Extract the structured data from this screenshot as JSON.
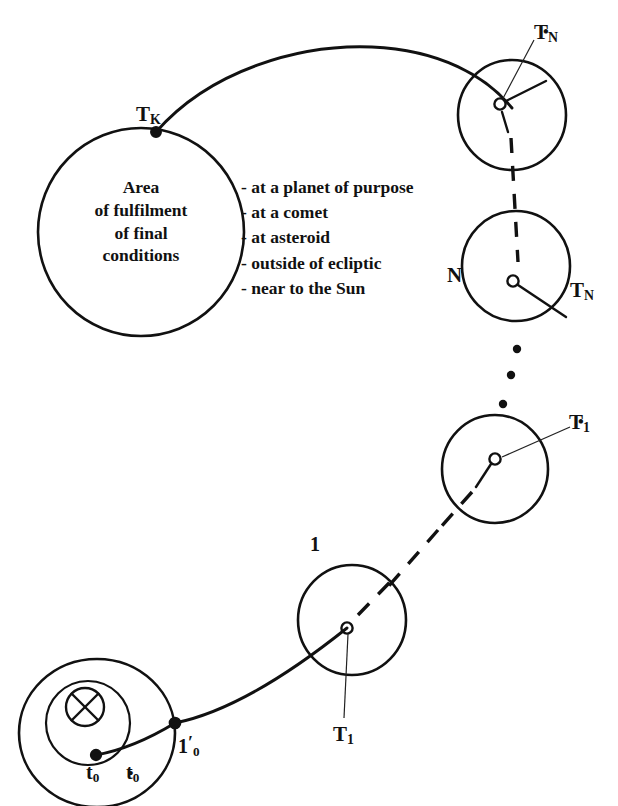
{
  "diagram": {
    "area_circle": {
      "name": "area-of-fulfilment",
      "lines": [
        "Area",
        "of fulfilment",
        "of final",
        "conditions"
      ]
    },
    "conditions_list": {
      "name": "final-conditions-list",
      "items": [
        "- at a planet of purpose",
        "- at a comet",
        "- at asteroid",
        "- outside of ecliptic",
        "- near to the Sun"
      ]
    },
    "labels": {
      "tk": {
        "base": "T",
        "sub": "K",
        "star": false
      },
      "tn_star": {
        "base": "T",
        "sub": "N",
        "star": true
      },
      "tn": {
        "base": "T",
        "sub": "N",
        "star": false
      },
      "n": {
        "base": "N",
        "sub": "",
        "star": false
      },
      "t1_star": {
        "base": "T",
        "sub": "1",
        "star": true
      },
      "t1": {
        "base": "T",
        "sub": "1",
        "star": false
      },
      "one": {
        "base": "1",
        "sub": "",
        "star": false
      },
      "t0": {
        "base": "t",
        "sub": "0",
        "star": false
      },
      "t0_star": {
        "base": "t",
        "sub": "0",
        "star": true
      },
      "one_prime_0": {
        "base": "1",
        "sub": "0",
        "prime": true,
        "star": false
      }
    },
    "colors": {
      "ink": "#111111",
      "background": "#ffffff"
    },
    "ellipsis": {
      "name": "vertical-ellipsis",
      "dots": 3
    }
  }
}
